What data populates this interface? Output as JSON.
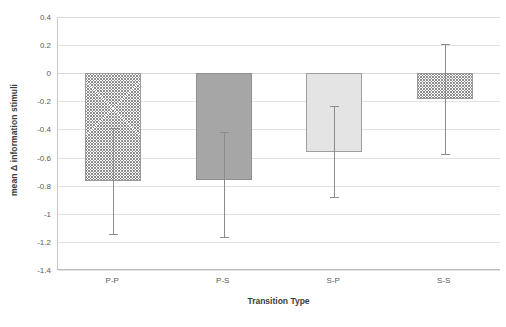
{
  "chart_data": {
    "type": "bar",
    "title": "",
    "xlabel": "Transition Type",
    "ylabel": "mean Δ information stimuli",
    "categories": [
      "P-P",
      "P-S",
      "S-P",
      "S-S"
    ],
    "values": [
      -0.77,
      -0.76,
      -0.56,
      -0.18
    ],
    "error_upper": [
      -0.39,
      -0.42,
      -0.23,
      0.21
    ],
    "error_lower": [
      -1.15,
      -1.17,
      -0.89,
      -0.58
    ],
    "ylim": [
      -1.4,
      0.4
    ],
    "ytick_step": 0.2,
    "ytick_labels": [
      "0.4",
      "0.2",
      "0",
      "-0.2",
      "-0.4",
      "-0.6",
      "-0.8",
      "-1",
      "-1.2",
      "-1.4"
    ],
    "ytick_values": [
      0.4,
      0.2,
      0,
      -0.2,
      -0.4,
      -0.6,
      -0.8,
      -1.0,
      -1.2,
      -1.4
    ],
    "grid": true,
    "legend": "none",
    "bar_styles": [
      "hatch",
      "dark",
      "light",
      "hatch"
    ],
    "colors": {
      "hatch": "#8d8d8d",
      "dark": "#a6a6a6",
      "light": "#e4e4e4",
      "gridline": "#e2e2e2",
      "axis": "#bdbdbd",
      "text": "#5a5a5a",
      "title_text": "#3b3b3b",
      "errorbar": "#8c8c8c",
      "background": "#ffffff"
    }
  }
}
